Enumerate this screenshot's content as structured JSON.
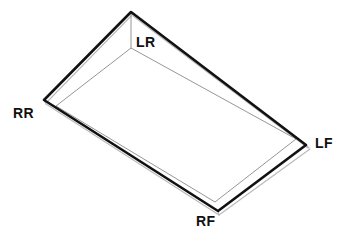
{
  "diagram": {
    "object_type": "rectangular-tray",
    "canvas": {
      "width": 346,
      "height": 238,
      "background": "#ffffff"
    },
    "colors": {
      "outer_edge": "#111111",
      "inner_edge": "#8a8a8a",
      "thickness_edge": "#b4b4b4",
      "label_text": "#111111",
      "background": "#ffffff"
    },
    "line_weights": {
      "outer_rim": 2.6,
      "inner_floor": 0.9,
      "thickness_offset": 1.1
    },
    "corners": [
      {
        "id": "LR",
        "label": "LR",
        "meaning": "left rear",
        "vertex": {
          "x": 131,
          "y": 12
        },
        "inner_vertex": {
          "x": 131,
          "y": 48
        },
        "label_position": {
          "x": 136,
          "y": 35
        }
      },
      {
        "id": "RR",
        "label": "RR",
        "meaning": "right rear",
        "vertex": {
          "x": 44,
          "y": 100
        },
        "inner_vertex": {
          "x": 56,
          "y": 106
        },
        "label_position": {
          "x": 13,
          "y": 106
        }
      },
      {
        "id": "LF",
        "label": "LF",
        "meaning": "left front",
        "vertex": {
          "x": 306,
          "y": 145
        },
        "inner_vertex": {
          "x": 296,
          "y": 139
        },
        "label_position": {
          "x": 315,
          "y": 136
        }
      },
      {
        "id": "RF",
        "label": "RF",
        "meaning": "right front",
        "vertex": {
          "x": 218,
          "y": 211
        },
        "inner_vertex": {
          "x": 215,
          "y": 202
        },
        "label_position": {
          "x": 196,
          "y": 214
        }
      }
    ],
    "outer_rim_path": "M 131 12 L 44 100 L 218 211 L 306 145 Z",
    "inner_floor_path": "M 131 48 L 56 106 L 215 202 L 296 139 Z",
    "thickness_path": "M 44 103 L 218 215 L 309 148 L 306 145",
    "corner_drop_line": {
      "from": {
        "x": 131,
        "y": 12
      },
      "to": {
        "x": 131,
        "y": 48
      }
    }
  }
}
